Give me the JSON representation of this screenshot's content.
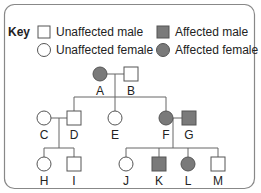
{
  "key": {
    "title": "Key",
    "items": [
      {
        "symbol": "square-open",
        "label": "Unaffected male"
      },
      {
        "symbol": "circle-open",
        "label": "Unaffected female"
      },
      {
        "symbol": "square-filled",
        "label": "Affected male"
      },
      {
        "symbol": "circle-filled",
        "label": "Affected female"
      }
    ]
  },
  "colors": {
    "affected_fill": "#7a7a7a",
    "affected_stroke": "#555555",
    "line": "#666666",
    "border": "#888888"
  },
  "pedigree": {
    "generation1": [
      {
        "id": "A",
        "sex": "female",
        "affected": true
      },
      {
        "id": "B",
        "sex": "male",
        "affected": false
      }
    ],
    "generation2": [
      {
        "id": "C",
        "sex": "female",
        "affected": false,
        "spouse_of": "D"
      },
      {
        "id": "D",
        "sex": "male",
        "affected": false,
        "parents": "A+B"
      },
      {
        "id": "E",
        "sex": "female",
        "affected": false,
        "parents": "A+B"
      },
      {
        "id": "F",
        "sex": "female",
        "affected": true,
        "parents": "A+B"
      },
      {
        "id": "G",
        "sex": "male",
        "affected": true,
        "spouse_of": "F"
      }
    ],
    "generation3": [
      {
        "id": "H",
        "sex": "female",
        "affected": false,
        "parents": "C+D"
      },
      {
        "id": "I",
        "sex": "male",
        "affected": false,
        "parents": "C+D"
      },
      {
        "id": "J",
        "sex": "female",
        "affected": false,
        "parents": "F+G"
      },
      {
        "id": "K",
        "sex": "male",
        "affected": true,
        "parents": "F+G"
      },
      {
        "id": "L",
        "sex": "female",
        "affected": true,
        "parents": "F+G"
      },
      {
        "id": "M",
        "sex": "male",
        "affected": false,
        "parents": "F+G"
      }
    ]
  },
  "labels": {
    "A": "A",
    "B": "B",
    "C": "C",
    "D": "D",
    "E": "E",
    "F": "F",
    "G": "G",
    "H": "H",
    "I": "I",
    "J": "J",
    "K": "K",
    "L": "L",
    "M": "M"
  }
}
